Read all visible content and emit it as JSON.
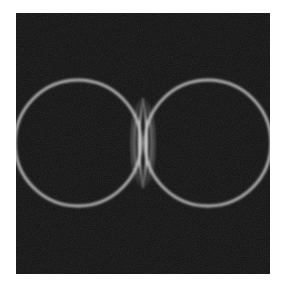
{
  "image": {
    "description": "Grayscale interference pattern: two bright circular rings on a dark noisy background with vertical interference fringes where they meet",
    "colors": {
      "background": "#101010",
      "ring": "#b8b8b8",
      "fringe": "#e6e6e6",
      "page": "#ffffff"
    },
    "rings": [
      {
        "name": "left",
        "cx": 62,
        "cy": 130,
        "r": 63
      },
      {
        "name": "right",
        "cx": 192,
        "cy": 130,
        "r": 63
      }
    ]
  }
}
